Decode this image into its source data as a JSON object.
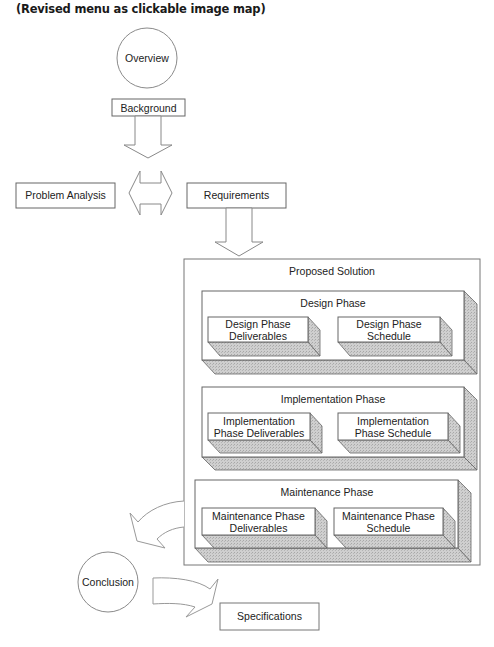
{
  "caption": "(Revised menu as clickable image map)",
  "colors": {
    "stroke": "#555555",
    "shadow": "#c6c6c6",
    "face": "#ffffff",
    "text": "#222222"
  },
  "nodes": {
    "overview": {
      "label": "Overview",
      "shape": "circle"
    },
    "background": {
      "label": "Background",
      "shape": "box"
    },
    "problem_analysis": {
      "label": "Problem Analysis",
      "shape": "box"
    },
    "requirements": {
      "label": "Requirements",
      "shape": "box"
    },
    "proposed_solution": {
      "label": "Proposed Solution",
      "phases": [
        {
          "label": "Design Phase",
          "children": [
            {
              "line1": "Design Phase",
              "line2": "Deliverables"
            },
            {
              "line1": "Design Phase",
              "line2": "Schedule"
            }
          ]
        },
        {
          "label": "Implementation Phase",
          "children": [
            {
              "line1": "Implementation",
              "line2": "Phase Deliverables"
            },
            {
              "line1": "Implementation",
              "line2": "Phase Schedule"
            }
          ]
        },
        {
          "label": "Maintenance Phase",
          "children": [
            {
              "line1": "Maintenance Phase",
              "line2": "Deliverables"
            },
            {
              "line1": "Maintenance Phase",
              "line2": "Schedule"
            }
          ]
        }
      ]
    },
    "conclusion": {
      "label": "Conclusion",
      "shape": "circle"
    },
    "specifications": {
      "label": "Specifications",
      "shape": "box"
    }
  },
  "arrows": [
    {
      "from": "Background",
      "to": "Problem Analysis / Requirements",
      "type": "down-block-arrow"
    },
    {
      "from": "Problem Analysis",
      "to": "Requirements",
      "type": "double-block-arrow"
    },
    {
      "from": "Requirements",
      "to": "Proposed Solution",
      "type": "down-block-arrow"
    },
    {
      "from": "Proposed Solution",
      "to": "Conclusion",
      "type": "curved-block-arrow"
    },
    {
      "from": "Conclusion",
      "to": "Specifications",
      "type": "curved-block-arrow"
    }
  ]
}
